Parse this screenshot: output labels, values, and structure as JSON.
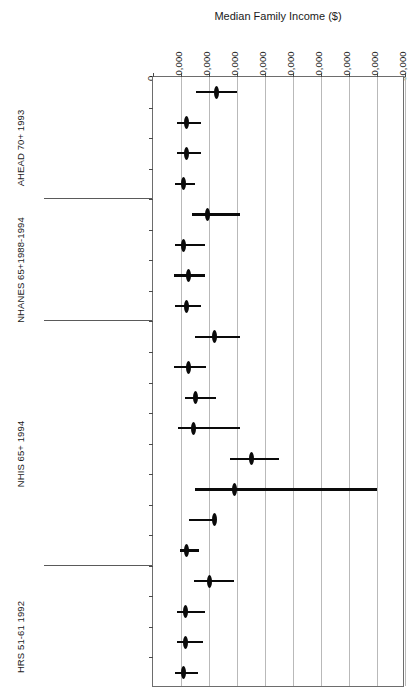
{
  "chart_data": {
    "type": "scatter",
    "title": "Median Family Income ($)",
    "xlabel": "Median Family Income ($)",
    "ylabel": "",
    "xlim": [
      0,
      90000
    ],
    "xticks": [
      0,
      10000,
      20000,
      30000,
      40000,
      50000,
      60000,
      70000,
      80000,
      90000
    ],
    "xtick_labels": [
      "0",
      "10,000",
      "20,000",
      "30,000",
      "40,000",
      "50,000",
      "60,000",
      "70,000",
      "80,000",
      "90,000"
    ],
    "grid": true,
    "legend": "none",
    "orientation": "horizontal",
    "marker_style": "filled-ellipse with horizontal confidence-interval whisker",
    "groups": [
      {
        "name": "AHEAD 70+ 1993",
        "rows": [
          {
            "label": "White",
            "value": 22500,
            "ci_low": 15500,
            "ci_high": 30000
          },
          {
            "label": "Black",
            "value": 12000,
            "ci_low": 8500,
            "ci_high": 17000
          },
          {
            "label": "U.S.-born Hispanic",
            "value": 12000,
            "ci_low": 8500,
            "ci_high": 17000
          },
          {
            "label": "Foreign-born\nHispanic",
            "value": 11000,
            "ci_low": 8000,
            "ci_high": 15000
          }
        ]
      },
      {
        "name": "NHANES 65+1988-1994",
        "rows": [
          {
            "label": "White",
            "value": 19500,
            "ci_low": 14000,
            "ci_high": 31000
          },
          {
            "label": "Black",
            "value": 11000,
            "ci_low": 8000,
            "ci_high": 18500
          },
          {
            "label": "U.S.-born Hispanic",
            "value": 12500,
            "ci_low": 7500,
            "ci_high": 18500
          },
          {
            "label": "Foreign-born\nHispanic",
            "value": 12000,
            "ci_low": 8000,
            "ci_high": 17000
          }
        ]
      },
      {
        "name": "NHIS 65+ 1994",
        "rows": [
          {
            "label": "White",
            "value": 22000,
            "ci_low": 15000,
            "ci_high": 31000
          },
          {
            "label": "Black",
            "value": 12500,
            "ci_low": 7500,
            "ci_high": 19000
          },
          {
            "label": "U.S.-born Hispanic",
            "value": 15000,
            "ci_low": 11500,
            "ci_high": 22500
          },
          {
            "label": "Foreign-born\nHispanic",
            "value": 14500,
            "ci_low": 9000,
            "ci_high": 31000
          },
          {
            "label": "U.S-born Asian",
            "value": 35000,
            "ci_low": 27500,
            "ci_high": 45000
          },
          {
            "label": "Foreign-born Asian",
            "value": 29000,
            "ci_low": 15000,
            "ci_high": 80000
          },
          {
            "label": "Native American",
            "value": 22000,
            "ci_low": 13000,
            "ci_high": 22500
          },
          {
            "label": "Foreign-born\nMexican",
            "value": 12000,
            "ci_low": 9500,
            "ci_high": 16500
          }
        ]
      },
      {
        "name": "HRS 51-61 1992",
        "rows": [
          {
            "label": "White",
            "value": 20000,
            "ci_low": 14500,
            "ci_high": 29000
          },
          {
            "label": "Black",
            "value": 11500,
            "ci_low": 8500,
            "ci_high": 18500
          },
          {
            "label": "U.S.-born Hispanic",
            "value": 11500,
            "ci_low": 8500,
            "ci_high": 18000
          },
          {
            "label": "Foreign-born\nHispanic",
            "value": 11000,
            "ci_low": 8000,
            "ci_high": 16000
          }
        ]
      }
    ]
  },
  "colors": {
    "marker": "#0a0a0a",
    "gridline": "#b9b9b9",
    "axis": "#6d6d6d",
    "text": "#1a1a1a",
    "background": "#ffffff"
  }
}
